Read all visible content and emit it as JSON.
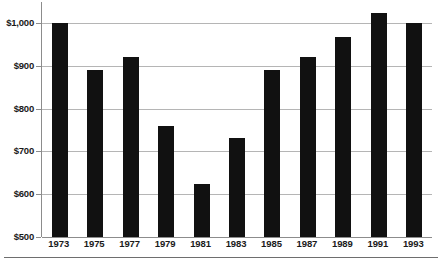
{
  "chart_data": {
    "type": "bar",
    "title": "",
    "subtitle": "",
    "xlabel": "",
    "ylabel": "",
    "categories": [
      "1973",
      "1975",
      "1977",
      "1979",
      "1981",
      "1983",
      "1985",
      "1987",
      "1989",
      "1991",
      "1993"
    ],
    "values": [
      1000,
      890,
      920,
      760,
      623,
      730,
      890,
      920,
      968,
      1025,
      1000
    ],
    "ylim": [
      500,
      1050
    ],
    "y_axis_ticks": [
      500,
      600,
      700,
      800,
      900,
      1000
    ],
    "y_tick_labels": [
      "$500",
      "$600",
      "$700",
      "$800",
      "$900",
      "$1,000"
    ],
    "grid": true,
    "legend": null,
    "legend_position": "none",
    "bar_color": "#111111",
    "gridline_color": "#b5b5b5",
    "axis_color": "#8c8c8c",
    "annotations": []
  }
}
